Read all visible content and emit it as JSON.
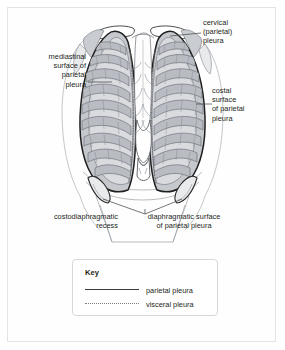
{
  "figure": {
    "background_color": "#ffffff",
    "frame_color": "#e3e3e3"
  },
  "labels": {
    "mediastinal": "mediastinal\nsurface of\nparietal\npleura",
    "cervical": "cervical\n(parietal)\npleura",
    "costal": "costal\nsurface\nof parietal\npleura",
    "recess": "costodiaphragmatic\nrecess",
    "diaphragmatic": "diaphragmatic surface\nof parietal pleura"
  },
  "key": {
    "title": "Key",
    "entries": [
      {
        "label": "parietal pleura",
        "style": "solid",
        "color": "#3b3b3b"
      },
      {
        "label": "visceral pleura",
        "style": "dotted",
        "color": "#7c7c7c"
      }
    ]
  },
  "illustration": {
    "view": "anterior thorax",
    "structures": [
      "clavicle",
      "sternum",
      "xiphoid process",
      "ribs",
      "costal cartilage",
      "left lung",
      "right lung",
      "diaphragm",
      "costodiaphragmatic recess",
      "mediastinum"
    ],
    "colors": {
      "pleura_outline": "#222222",
      "lung_fill": "#d8dade",
      "rib_fill": "#b9bcc2",
      "bone_fill": "#ffffff",
      "soft_line": "#8f9399",
      "shadow_fill": "#9aa0a6"
    }
  }
}
